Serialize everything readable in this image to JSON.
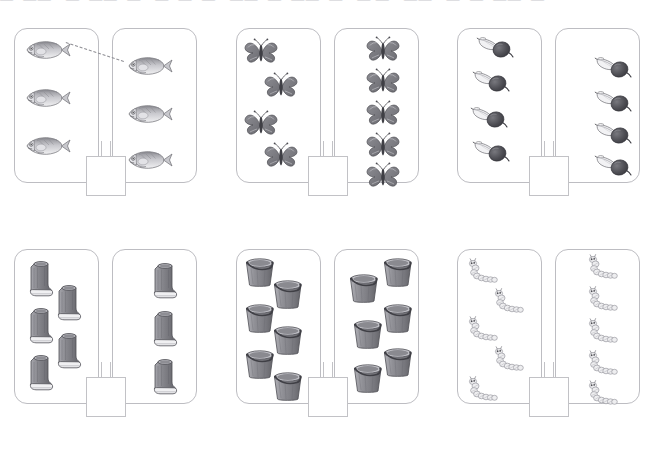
{
  "worksheet": {
    "title_strip_text": "—  ——   —  ——  —   —  —  —   ——  —  ——  —   — —   ——   —  —  ——  —",
    "answer_value": "",
    "colors": {
      "card_border": "#bdbdc2",
      "answer_border": "#c2c2c6",
      "match_line": "#8e8e94",
      "page_background": "#ffffff",
      "object_dark": "#55555a",
      "object_mid": "#8c8c92",
      "object_light": "#c8c8cd"
    }
  },
  "panels": [
    {
      "id": "panel-1",
      "object_name": "fish",
      "left_count": 3,
      "right_count": 3,
      "answer": "",
      "has_match_line": true,
      "match_line_label": "fish-match-line"
    },
    {
      "id": "panel-2",
      "object_name": "butterfly",
      "left_count": 4,
      "right_count": 5,
      "answer": "",
      "has_match_line": false,
      "match_line_label": ""
    },
    {
      "id": "panel-3",
      "object_name": "beet",
      "left_count": 4,
      "right_count": 4,
      "answer": "",
      "has_match_line": false,
      "match_line_label": ""
    },
    {
      "id": "panel-4",
      "object_name": "boot",
      "left_count": 5,
      "right_count": 3,
      "answer": "",
      "has_match_line": false,
      "match_line_label": ""
    },
    {
      "id": "panel-5",
      "object_name": "bucket",
      "left_count": 6,
      "right_count": 6,
      "answer": "",
      "has_match_line": false,
      "match_line_label": ""
    },
    {
      "id": "panel-6",
      "object_name": "caterpillar",
      "left_count": 5,
      "right_count": 5,
      "answer": "",
      "has_match_line": false,
      "match_line_label": ""
    }
  ],
  "layout": {
    "panel_origins": [
      {
        "x": 14,
        "y": 28
      },
      {
        "x": 236,
        "y": 28
      },
      {
        "x": 457,
        "y": 28
      },
      {
        "x": 14,
        "y": 249
      },
      {
        "x": 236,
        "y": 249
      },
      {
        "x": 457,
        "y": 249
      }
    ],
    "card_width": 85,
    "card_height": 155,
    "card_gap": 13,
    "answer_box_size": 40
  },
  "item_positions": {
    "fish_left": [
      [
        10,
        10
      ],
      [
        10,
        58
      ],
      [
        10,
        106
      ]
    ],
    "fish_right": [
      [
        14,
        26
      ],
      [
        14,
        74
      ],
      [
        14,
        120
      ]
    ],
    "butterfly_left": [
      [
        6,
        8
      ],
      [
        26,
        42
      ],
      [
        6,
        80
      ],
      [
        26,
        112
      ]
    ],
    "butterfly_right": [
      [
        30,
        6
      ],
      [
        30,
        38
      ],
      [
        30,
        70
      ],
      [
        30,
        102
      ],
      [
        30,
        132
      ]
    ],
    "beet_left": [
      [
        18,
        6
      ],
      [
        14,
        40
      ],
      [
        12,
        76
      ],
      [
        14,
        110
      ]
    ],
    "beet_right": [
      [
        38,
        26
      ],
      [
        38,
        60
      ],
      [
        38,
        92
      ],
      [
        38,
        124
      ]
    ],
    "boot_left": [
      [
        12,
        8
      ],
      [
        12,
        55
      ],
      [
        12,
        102
      ],
      [
        40,
        32
      ],
      [
        40,
        80
      ]
    ],
    "boot_right": [
      [
        38,
        10
      ],
      [
        38,
        58
      ],
      [
        38,
        106
      ]
    ],
    "bucket_left": [
      [
        6,
        6
      ],
      [
        34,
        28
      ],
      [
        6,
        52
      ],
      [
        34,
        74
      ],
      [
        6,
        98
      ],
      [
        34,
        120
      ]
    ],
    "bucket_right": [
      [
        12,
        22
      ],
      [
        46,
        6
      ],
      [
        16,
        68
      ],
      [
        46,
        52
      ],
      [
        16,
        112
      ],
      [
        46,
        96
      ]
    ],
    "caterpillar_left": [
      [
        6,
        8
      ],
      [
        32,
        38
      ],
      [
        6,
        66
      ],
      [
        32,
        96
      ],
      [
        6,
        126
      ]
    ],
    "caterpillar_right": [
      [
        28,
        4
      ],
      [
        28,
        36
      ],
      [
        28,
        68
      ],
      [
        28,
        100
      ],
      [
        28,
        130
      ]
    ]
  }
}
